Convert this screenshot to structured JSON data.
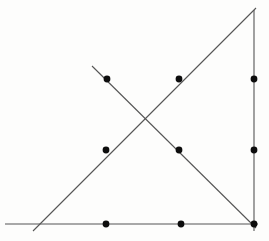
{
  "page": {
    "width": 269,
    "height": 241,
    "background_color": "#fdfdfc"
  },
  "figure": {
    "name": "triangle-with-crossing-cevian-and-points",
    "stroke_color": "#555555",
    "dot_color": "#0d0d0d",
    "line_width": 1.1,
    "dot_radius": 3.4
  },
  "chart_data": {
    "type": "scatter",
    "title": "",
    "subtitle": "",
    "xlabel": "",
    "ylabel": "",
    "grid": false,
    "legend": null,
    "xlim": [
      0,
      269
    ],
    "ylim": [
      0,
      241
    ],
    "lines": [
      {
        "name": "base-horizontal-line",
        "label": "Horizontal base",
        "x1": 5,
        "y1": 224,
        "x2": 258,
        "y2": 224
      },
      {
        "name": "right-vertical-line",
        "label": "Vertical right side",
        "x1": 254,
        "y1": 10,
        "x2": 254,
        "y2": 231
      },
      {
        "name": "ascending-diagonal-line",
        "label": "Ascending hypotenuse",
        "x1": 33,
        "y1": 231,
        "x2": 256,
        "y2": 8
      },
      {
        "name": "descending-diagonal-line",
        "label": "Descending crossing segment",
        "x1": 92,
        "y1": 66,
        "x2": 256,
        "y2": 228
      }
    ],
    "points": [
      {
        "name": "point-top-left",
        "label": "P1",
        "x": 107,
        "y": 79
      },
      {
        "name": "point-top-middle",
        "label": "P2",
        "x": 179,
        "y": 79
      },
      {
        "name": "point-top-right",
        "label": "P3",
        "x": 254,
        "y": 79
      },
      {
        "name": "point-mid-left",
        "label": "P4",
        "x": 106,
        "y": 150
      },
      {
        "name": "point-mid-middle",
        "label": "P5",
        "x": 179,
        "y": 150
      },
      {
        "name": "point-mid-right",
        "label": "P6",
        "x": 254,
        "y": 150
      },
      {
        "name": "point-bottom-left",
        "label": "P7",
        "x": 106,
        "y": 224
      },
      {
        "name": "point-bottom-middle",
        "label": "P8",
        "x": 181,
        "y": 224
      },
      {
        "name": "point-bottom-right",
        "label": "P9",
        "x": 254,
        "y": 224
      }
    ],
    "intersections": [
      {
        "name": "diagonal-crossing-point",
        "label": "X",
        "x": 149,
        "y": 120
      }
    ]
  }
}
